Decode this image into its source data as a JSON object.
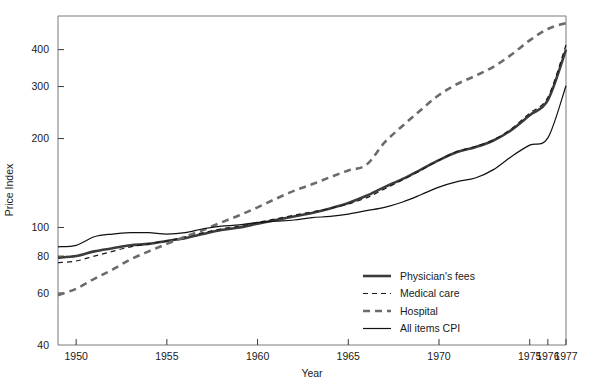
{
  "chart_data": {
    "type": "line",
    "title": "",
    "xlabel": "Year",
    "ylabel": "Price Index",
    "yscale": "log",
    "ylim": [
      40,
      520
    ],
    "xlim": [
      1949,
      1977
    ],
    "grid": false,
    "legend_position": "bottom-right",
    "y_ticks": [
      40,
      60,
      80,
      100,
      200,
      300,
      400
    ],
    "y_tick_labels": [
      "40",
      "60",
      "80",
      "100",
      "200",
      "300",
      "400"
    ],
    "x_ticks": [
      1950,
      1955,
      1960,
      1965,
      1970,
      1975,
      1976,
      1977
    ],
    "x_tick_labels": [
      "1950",
      "1955",
      "1960",
      "1965",
      "1970",
      "1975",
      "1976",
      "1977"
    ],
    "series": [
      {
        "name": "Physician's fees",
        "style": "solid",
        "width": "thick",
        "color": "#3c3c3c",
        "x": [
          1949,
          1950,
          1951,
          1952,
          1953,
          1954,
          1955,
          1956,
          1957,
          1958,
          1959,
          1960,
          1961,
          1962,
          1963,
          1964,
          1965,
          1966,
          1967,
          1968,
          1969,
          1970,
          1971,
          1972,
          1973,
          1974,
          1975,
          1976,
          1977
        ],
        "y": [
          79,
          80,
          83,
          85,
          87,
          88,
          90,
          92,
          95,
          98,
          100,
          103,
          106,
          109,
          112,
          116,
          121,
          128,
          137,
          146,
          157,
          169,
          180,
          187,
          197,
          214,
          240,
          270,
          400
        ]
      },
      {
        "name": "Medical care",
        "style": "dashed",
        "width": "thin",
        "color": "#1a1a1a",
        "x": [
          1949,
          1950,
          1951,
          1952,
          1953,
          1954,
          1955,
          1956,
          1957,
          1958,
          1959,
          1960,
          1961,
          1962,
          1963,
          1964,
          1965,
          1966,
          1967,
          1968,
          1969,
          1970,
          1971,
          1972,
          1973,
          1974,
          1975,
          1976,
          1977
        ],
        "y": [
          76,
          77,
          80,
          83,
          86,
          88,
          90,
          93,
          96,
          99,
          101,
          104,
          107,
          110,
          113,
          116,
          120,
          126,
          135,
          145,
          156,
          169,
          181,
          188,
          198,
          216,
          244,
          276,
          415
        ]
      },
      {
        "name": "Hospital",
        "style": "dashed",
        "width": "thick",
        "color": "#6b6b6b",
        "x": [
          1949,
          1950,
          1951,
          1952,
          1953,
          1954,
          1955,
          1956,
          1957,
          1958,
          1959,
          1960,
          1961,
          1962,
          1963,
          1964,
          1965,
          1966,
          1967,
          1968,
          1969,
          1970,
          1971,
          1972,
          1973,
          1974,
          1975,
          1976,
          1977
        ],
        "y": [
          59,
          62,
          67,
          72,
          78,
          83,
          88,
          93,
          98,
          104,
          110,
          117,
          125,
          133,
          140,
          148,
          156,
          163,
          194,
          221,
          250,
          281,
          306,
          326,
          350,
          385,
          430,
          470,
          492
        ]
      },
      {
        "name": "All items CPI",
        "style": "solid",
        "width": "thin",
        "color": "#111111",
        "x": [
          1949,
          1950,
          1951,
          1952,
          1953,
          1954,
          1955,
          1956,
          1957,
          1958,
          1959,
          1960,
          1961,
          1962,
          1963,
          1964,
          1965,
          1966,
          1967,
          1968,
          1969,
          1970,
          1971,
          1972,
          1973,
          1974,
          1975,
          1976,
          1977
        ],
        "y": [
          86,
          87,
          93,
          95,
          96,
          96,
          95,
          96,
          99,
          101,
          102,
          104,
          105,
          106,
          108,
          109,
          111,
          114,
          117,
          122,
          129,
          137,
          143,
          147,
          157,
          174,
          190,
          201,
          302
        ]
      }
    ],
    "legend_entries": [
      {
        "label": "Physician's fees",
        "style": "solid",
        "width": "thick",
        "color": "#3c3c3c"
      },
      {
        "label": "Medical care",
        "style": "dashed",
        "width": "thin",
        "color": "#1a1a1a"
      },
      {
        "label": "Hospital",
        "style": "dashed",
        "width": "thick",
        "color": "#6b6b6b"
      },
      {
        "label": "All items CPI",
        "style": "solid",
        "width": "thin",
        "color": "#111111"
      }
    ]
  }
}
